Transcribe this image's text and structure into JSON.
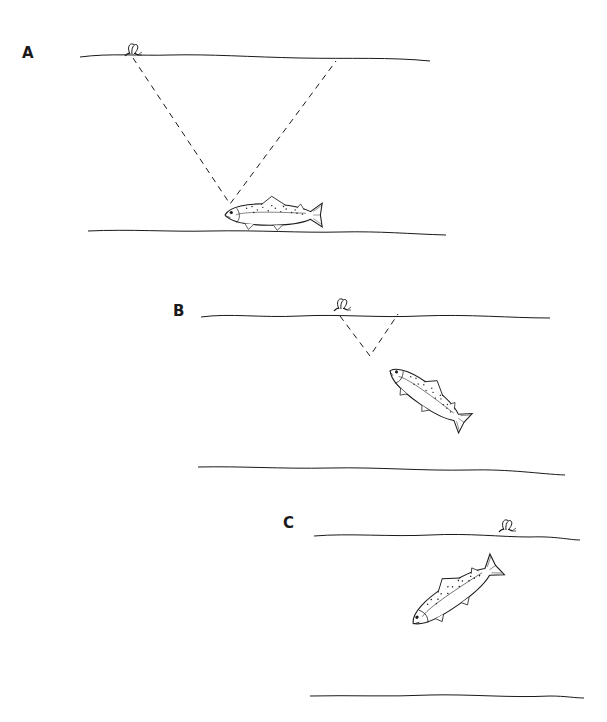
{
  "figure": {
    "panels": [
      {
        "label": "A",
        "description": "Trout resting on bottom; wide window of vision (dashed cone) reaching the fly on the surface"
      },
      {
        "label": "B",
        "description": "Trout rising toward surface; narrowing window of vision"
      },
      {
        "label": "C",
        "description": "Trout at surface turning toward the fly"
      }
    ],
    "colors": {
      "ink": "#1a1a1a",
      "background": "#ffffff"
    }
  }
}
